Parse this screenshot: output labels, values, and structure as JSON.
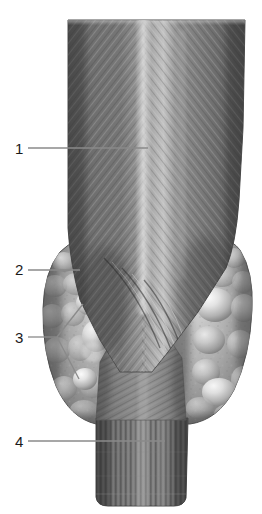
{
  "figure": {
    "background_color": "#ffffff",
    "ink_color": "#808080",
    "render_style": "grayscale anatomical illustration",
    "width": 262,
    "height": 514
  },
  "labels": [
    {
      "id": "1",
      "text": "1",
      "target": "trachea-larynx-upper",
      "leader": {
        "type": "straight",
        "x1": 28,
        "y1": 148,
        "x2": 148,
        "y2": 148
      }
    },
    {
      "id": "2",
      "text": "2",
      "target": "thyroid-lobe-left",
      "leader": {
        "type": "straight",
        "x1": 28,
        "y1": 270,
        "x2": 80,
        "y2": 270
      }
    },
    {
      "id": "3",
      "text": "3",
      "target": "parathyroid-nodules",
      "leader": {
        "type": "forked",
        "x1": 28,
        "y1": 337,
        "vx": 57,
        "vy": 337,
        "ax": 83,
        "ay": 304,
        "bx": 79,
        "by": 379
      }
    },
    {
      "id": "4",
      "text": "4",
      "target": "trachea-lower",
      "leader": {
        "type": "straight",
        "x1": 28,
        "y1": 441,
        "x2": 165,
        "y2": 441
      }
    }
  ],
  "structures": [
    {
      "name": "larynx-trachea-upper",
      "label_ref": "1"
    },
    {
      "name": "thyroid-lobe-left",
      "label_ref": "2"
    },
    {
      "name": "thyroid-lobe-right",
      "label_ref": "2"
    },
    {
      "name": "parathyroid-nodule-superior",
      "label_ref": "3"
    },
    {
      "name": "parathyroid-nodule-inferior",
      "label_ref": "3"
    },
    {
      "name": "trachea-lower",
      "label_ref": "4"
    },
    {
      "name": "thyroid-isthmus",
      "label_ref": ""
    }
  ]
}
